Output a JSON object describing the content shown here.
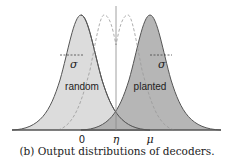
{
  "figure": {
    "caption": "(b) Output distributions of decoders.",
    "curves": [
      {
        "name": "random",
        "label": "random",
        "mean_label": "0",
        "spread_label": "σ",
        "fill": "#dcdcdc"
      },
      {
        "name": "planted",
        "label": "planted",
        "mean_label": "μ",
        "spread_label": "σ",
        "fill": "#a9a9a9"
      }
    ],
    "threshold_label": "η",
    "axis_labels": [
      "0",
      "η",
      "μ"
    ]
  }
}
